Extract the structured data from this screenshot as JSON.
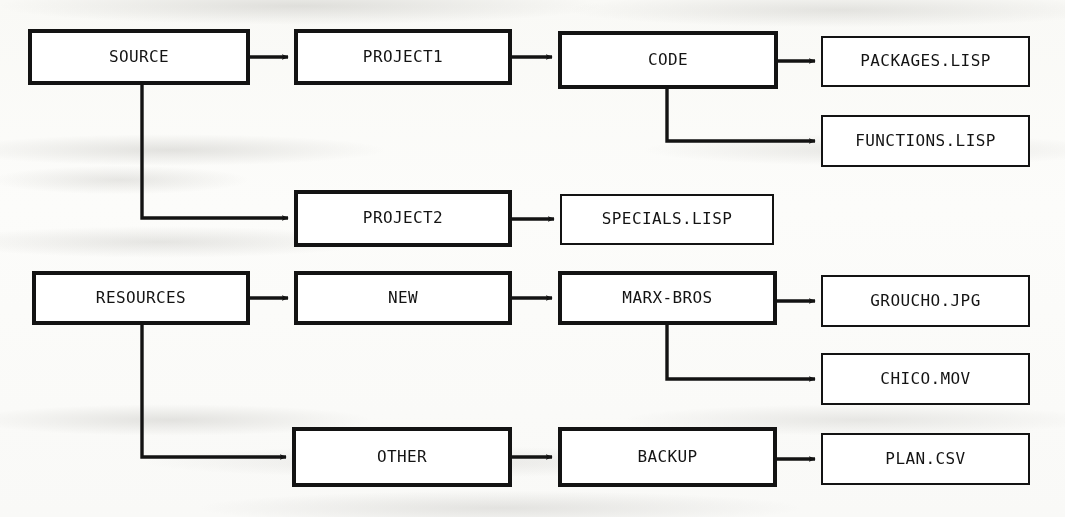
{
  "diagram": {
    "colors": {
      "ink": "#131313",
      "paper": "#fdfdfc",
      "box_fill": "#ffffff"
    },
    "nodes": [
      {
        "id": "source",
        "label": "SOURCE",
        "kind": "directory",
        "x": 28,
        "y": 29,
        "w": 222,
        "h": 56
      },
      {
        "id": "project1",
        "label": "PROJECT1",
        "kind": "directory",
        "x": 294,
        "y": 29,
        "w": 218,
        "h": 56
      },
      {
        "id": "code",
        "label": "CODE",
        "kind": "directory",
        "x": 558,
        "y": 31,
        "w": 220,
        "h": 58
      },
      {
        "id": "packages",
        "label": "PACKAGES.LISP",
        "kind": "file",
        "x": 821,
        "y": 36,
        "w": 209,
        "h": 51
      },
      {
        "id": "functions",
        "label": "FUNCTIONS.LISP",
        "kind": "file",
        "x": 821,
        "y": 115,
        "w": 209,
        "h": 52
      },
      {
        "id": "project2",
        "label": "PROJECT2",
        "kind": "directory",
        "x": 294,
        "y": 190,
        "w": 218,
        "h": 57
      },
      {
        "id": "specials",
        "label": "SPECIALS.LISP",
        "kind": "file",
        "x": 560,
        "y": 194,
        "w": 214,
        "h": 51
      },
      {
        "id": "resources",
        "label": "RESOURCES",
        "kind": "directory",
        "x": 32,
        "y": 271,
        "w": 218,
        "h": 54
      },
      {
        "id": "new",
        "label": "NEW",
        "kind": "directory",
        "x": 294,
        "y": 271,
        "w": 218,
        "h": 54
      },
      {
        "id": "marxbros",
        "label": "MARX-BROS",
        "kind": "directory",
        "x": 558,
        "y": 271,
        "w": 219,
        "h": 54
      },
      {
        "id": "groucho",
        "label": "GROUCHO.JPG",
        "kind": "file",
        "x": 821,
        "y": 275,
        "w": 209,
        "h": 52
      },
      {
        "id": "chico",
        "label": "CHICO.MOV",
        "kind": "file",
        "x": 821,
        "y": 353,
        "w": 209,
        "h": 52
      },
      {
        "id": "other",
        "label": "OTHER",
        "kind": "directory",
        "x": 292,
        "y": 427,
        "w": 220,
        "h": 60
      },
      {
        "id": "backup",
        "label": "BACKUP",
        "kind": "directory",
        "x": 558,
        "y": 427,
        "w": 219,
        "h": 60
      },
      {
        "id": "plan",
        "label": "PLAN.CSV",
        "kind": "file",
        "x": 821,
        "y": 433,
        "w": 209,
        "h": 52
      }
    ],
    "edges": [
      {
        "id": "source-project1",
        "from": "source",
        "to": "project1",
        "style": "straight",
        "points": "250,57 288,57"
      },
      {
        "id": "source-project2",
        "from": "source",
        "to": "project2",
        "style": "elbow",
        "points": "142,85 142,218 288,218"
      },
      {
        "id": "project1-code",
        "from": "project1",
        "to": "code",
        "style": "straight",
        "points": "512,57 552,57"
      },
      {
        "id": "code-packages",
        "from": "code",
        "to": "packages",
        "style": "straight",
        "points": "778,61 815,61"
      },
      {
        "id": "code-functions",
        "from": "code",
        "to": "functions",
        "style": "elbow",
        "points": "667,89 667,141 815,141"
      },
      {
        "id": "project2-specials",
        "from": "project2",
        "to": "specials",
        "style": "straight",
        "points": "512,219 554,219"
      },
      {
        "id": "resources-new",
        "from": "resources",
        "to": "new",
        "style": "straight",
        "points": "250,298 288,298"
      },
      {
        "id": "resources-other",
        "from": "resources",
        "to": "other",
        "style": "elbow",
        "points": "142,325 142,457 286,457"
      },
      {
        "id": "new-marxbros",
        "from": "new",
        "to": "marxbros",
        "style": "straight",
        "points": "512,298 552,298"
      },
      {
        "id": "marxbros-groucho",
        "from": "marxbros",
        "to": "groucho",
        "style": "straight",
        "points": "777,301 815,301"
      },
      {
        "id": "marxbros-chico",
        "from": "marxbros",
        "to": "chico",
        "style": "elbow",
        "points": "667,325 667,379 815,379"
      },
      {
        "id": "other-backup",
        "from": "other",
        "to": "backup",
        "style": "straight",
        "points": "512,457 552,457"
      },
      {
        "id": "backup-plan",
        "from": "backup",
        "to": "plan",
        "style": "straight",
        "points": "777,459 815,459"
      }
    ]
  }
}
